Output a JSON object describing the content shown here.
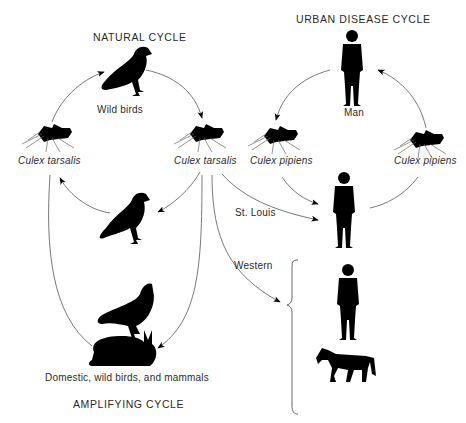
{
  "diagram": {
    "titles": {
      "natural_cycle": "NATURAL CYCLE",
      "urban_cycle": "URBAN DISEASE CYCLE",
      "amplifying_cycle": "AMPLIFYING CYCLE"
    },
    "labels": {
      "wild_birds": "Wild birds",
      "man": "Man",
      "culex_tarsalis_left": "Culex tarsalis",
      "culex_tarsalis_center": "Culex tarsalis",
      "culex_pipiens_left": "Culex pipiens",
      "culex_pipiens_right": "Culex pipiens",
      "st_louis": "St. Louis",
      "western": "Western",
      "domestic_hosts": "Domestic, wild birds, and mammals"
    },
    "nodes": [
      {
        "id": "wild-bird-top",
        "icon": "bird-icon"
      },
      {
        "id": "culex-tarsalis-left",
        "icon": "mosquito-icon"
      },
      {
        "id": "culex-tarsalis-center",
        "icon": "mosquito-icon"
      },
      {
        "id": "bird-middle",
        "icon": "bird-icon"
      },
      {
        "id": "chicken-rabbit",
        "icon": "chicken-icon,rabbit-icon"
      },
      {
        "id": "man-top",
        "icon": "person-icon"
      },
      {
        "id": "culex-pipiens-left",
        "icon": "mosquito-icon"
      },
      {
        "id": "culex-pipiens-right",
        "icon": "mosquito-icon"
      },
      {
        "id": "man-st-louis",
        "icon": "person-icon"
      },
      {
        "id": "man-western",
        "icon": "person-icon"
      },
      {
        "id": "horse-western",
        "icon": "horse-icon"
      }
    ],
    "colors": {
      "ink": "#000000",
      "line": "#555555",
      "text": "#2a2a2a",
      "background": "#ffffff"
    }
  }
}
